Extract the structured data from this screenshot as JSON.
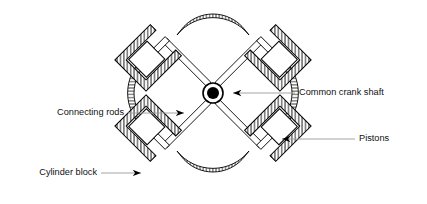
{
  "diagram": {
    "type": "engineering-cross-section",
    "colors": {
      "outline": "#000000",
      "hatch": "#000000",
      "leader_line": "#9a9a9a",
      "arrowhead": "#000000",
      "hub_fill": "#000000",
      "background": "#ffffff",
      "text": "#111111"
    },
    "labels": [
      {
        "id": "common-crank-shaft",
        "text": "Common crank shaft",
        "text_x": 299,
        "text_y": 93,
        "anchor": "start",
        "leader": {
          "x1": 295,
          "y1": 93,
          "x2": 228,
          "y2": 93
        },
        "arrow": {
          "x": 228,
          "y": 93,
          "dir": "left"
        }
      },
      {
        "id": "connecting-rods",
        "text": "Connecting rods",
        "text_x": 124,
        "text_y": 113,
        "anchor": "end",
        "leader": {
          "x1": 128,
          "y1": 113,
          "x2": 189,
          "y2": 113
        },
        "arrow": {
          "x": 189,
          "y": 113,
          "dir": "right"
        }
      },
      {
        "id": "pistons",
        "text": "Pistons",
        "text_x": 359,
        "text_y": 139,
        "anchor": "start",
        "leader": {
          "x1": 355,
          "y1": 139,
          "x2": 277,
          "y2": 139
        },
        "arrow": {
          "x": 277,
          "y": 139,
          "dir": "left"
        }
      },
      {
        "id": "cylinder-block",
        "text": "Cylinder block",
        "text_x": 97,
        "text_y": 173,
        "anchor": "end",
        "leader": {
          "x1": 101,
          "y1": 173,
          "x2": 146,
          "y2": 173
        },
        "arrow": {
          "x": 146,
          "y": 173,
          "dir": "right"
        }
      }
    ],
    "parts": {
      "crank_shaft": {
        "name": "common-crank-shaft",
        "center_x": 213,
        "center_y": 93,
        "hub_outer_radius": 10,
        "hub_inner_radius": 6
      },
      "connecting_rods": {
        "name": "connecting-rods",
        "count": 4,
        "angles_deg": [
          45,
          135,
          225,
          315
        ]
      },
      "cylinders": {
        "name": "cylinder-block",
        "count": 4,
        "positions": [
          "top-left",
          "top-right",
          "bottom-right",
          "bottom-left"
        ],
        "wall_hatched": true
      },
      "pistons": {
        "name": "pistons",
        "count": 4
      },
      "ring_arcs": {
        "name": "crankcase-ring",
        "count": 4,
        "positions": [
          "top",
          "right",
          "bottom",
          "left"
        ],
        "hatched": true
      }
    }
  }
}
